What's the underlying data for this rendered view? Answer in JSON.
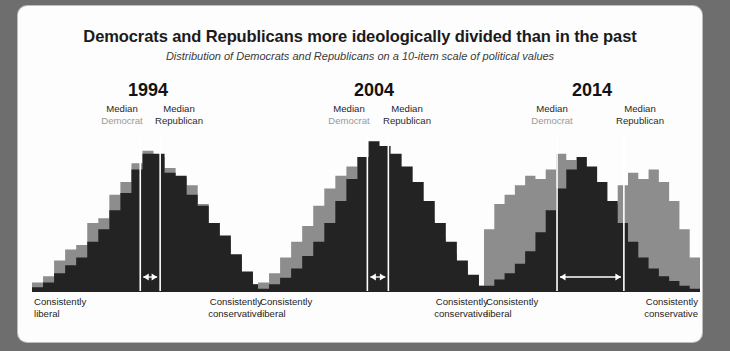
{
  "header": {
    "title": "Democrats and Republicans more ideologically divided than in the past",
    "subtitle": "Distribution of Democrats and Republicans on a 10-item scale of political values"
  },
  "colors": {
    "democrat_fill": "#8d8d8d",
    "republican_fill": "#232323",
    "median_line": "#ffffff",
    "page_background": "#6e6e6e",
    "card_background": "#fdfdfd",
    "title_text": "#1b1b1b"
  },
  "labels": {
    "median_word": "Median",
    "democrat_word": "Democrat",
    "republican_word": "Republican",
    "left_end_line1": "Consistently",
    "left_end_line2": "liberal",
    "right_end_line1": "Consistently",
    "right_end_line2": "conservative"
  },
  "chart_data": {
    "type": "area",
    "title": "Democrats and Republicans more ideologically divided than in the past",
    "subtitle": "Distribution of Democrats and Republicans on a 10-item scale of political values",
    "xlabel": "Consistently liberal — Consistently conservative",
    "ylabel": "Share of respondents",
    "grid": false,
    "legend": [
      "Median Democrat",
      "Median Republican"
    ],
    "legend_position": "inline-above-plot",
    "x": [
      0,
      1,
      2,
      3,
      4,
      5,
      6,
      7,
      8,
      9,
      10,
      11,
      12,
      13,
      14,
      15,
      16,
      17,
      18,
      19,
      20
    ],
    "xlim": [
      0,
      20
    ],
    "ylim": [
      0,
      100
    ],
    "panels": [
      {
        "year": "1994",
        "median_democrat_x": 9.3,
        "median_republican_x": 11.1,
        "arrow_label": "gap between medians",
        "series": [
          {
            "name": "Democrat",
            "color": "#8d8d8d",
            "values": [
              6,
              10,
              20,
              27,
              30,
              44,
              47,
              62,
              70,
              82,
              90,
              86,
              79,
              73,
              68,
              56,
              44,
              33,
              22,
              12,
              5
            ]
          },
          {
            "name": "Republican",
            "color": "#232323",
            "values": [
              3,
              6,
              12,
              17,
              22,
              32,
              40,
              52,
              63,
              78,
              88,
              88,
              76,
              74,
              62,
              55,
              44,
              36,
              24,
              13,
              5
            ]
          }
        ]
      },
      {
        "year": "2004",
        "median_democrat_x": 9.4,
        "median_republican_x": 11.3,
        "arrow_label": "gap between medians",
        "series": [
          {
            "name": "Democrat",
            "color": "#8d8d8d",
            "values": [
              6,
              12,
              22,
              32,
              42,
              55,
              66,
              74,
              80,
              86,
              84,
              78,
              72,
              66,
              56,
              46,
              34,
              24,
              16,
              9,
              4
            ]
          },
          {
            "name": "Republican",
            "color": "#232323",
            "values": [
              2,
              5,
              9,
              15,
              23,
              32,
              44,
              58,
              72,
              86,
              96,
              93,
              88,
              80,
              70,
              58,
              44,
              32,
              20,
              11,
              4
            ]
          }
        ]
      },
      {
        "year": "2014",
        "median_democrat_x": 6.6,
        "median_republican_x": 13.1,
        "arrow_label": "gap between medians",
        "series": [
          {
            "name": "Democrat",
            "color": "#8d8d8d",
            "values": [
              40,
              56,
              62,
              68,
              74,
              72,
              78,
              88,
              84,
              72,
              58,
              48,
              56,
              68,
              76,
              72,
              78,
              70,
              58,
              40,
              22
            ]
          },
          {
            "name": "Republican",
            "color": "#232323",
            "values": [
              4,
              8,
              12,
              18,
              26,
              38,
              52,
              66,
              78,
              86,
              80,
              70,
              58,
              44,
              32,
              22,
              15,
              10,
              7,
              4,
              2
            ]
          }
        ]
      }
    ]
  }
}
